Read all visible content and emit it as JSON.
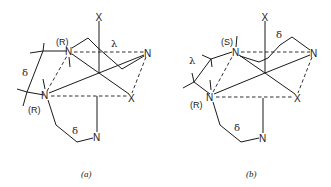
{
  "figure": {
    "panels": [
      {
        "id": "a",
        "caption": "(a)",
        "atoms": {
          "x_top": "X",
          "x_right": "X",
          "n_upper": "N",
          "n_right": "N",
          "n_left": "N",
          "n_bottom": "N"
        },
        "configurations": {
          "upper_n": "(R)",
          "lower_n": "(R)"
        },
        "ring_conformations": {
          "upper_ring": "λ",
          "left_ring": "δ",
          "lower_ring": "δ"
        }
      },
      {
        "id": "b",
        "caption": "(b)",
        "atoms": {
          "x_top": "X",
          "x_right": "X",
          "n_upper": "N",
          "n_right": "N",
          "n_left": "N",
          "n_bottom": "N"
        },
        "configurations": {
          "upper_n": "(S)",
          "lower_n": "(R)"
        },
        "ring_conformations": {
          "upper_ring": "δ",
          "left_ring": "λ",
          "lower_ring": "δ"
        }
      }
    ]
  }
}
